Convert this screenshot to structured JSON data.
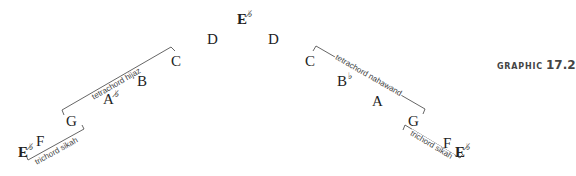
{
  "graphic": {
    "word": "GRAPHIC",
    "number": "17.2"
  },
  "accidentals": {
    "half_flat": "♭̸",
    "flat": "♭"
  },
  "top_note": {
    "letter": "E",
    "accidental": "half-flat",
    "accidental_glyph": "♭̸"
  },
  "left_scale": {
    "notes": [
      {
        "letter": "E",
        "accidental_glyph": "♭̸"
      },
      {
        "letter": "F",
        "accidental_glyph": ""
      },
      {
        "letter": "G",
        "accidental_glyph": ""
      },
      {
        "letter": "A",
        "accidental_glyph": "♭̸"
      },
      {
        "letter": "B",
        "accidental_glyph": ""
      },
      {
        "letter": "C",
        "accidental_glyph": ""
      },
      {
        "letter": "D",
        "accidental_glyph": ""
      }
    ],
    "brackets": [
      {
        "label": "trichord sikah"
      },
      {
        "label": "tetrachord hijaz"
      }
    ]
  },
  "right_scale": {
    "notes": [
      {
        "letter": "D",
        "accidental_glyph": ""
      },
      {
        "letter": "C",
        "accidental_glyph": ""
      },
      {
        "letter": "B",
        "accidental_glyph": "♭"
      },
      {
        "letter": "A",
        "accidental_glyph": ""
      },
      {
        "letter": "G",
        "accidental_glyph": ""
      },
      {
        "letter": "F",
        "accidental_glyph": ""
      },
      {
        "letter": "E",
        "accidental_glyph": "♭̸"
      }
    ],
    "brackets": [
      {
        "label": "tetrachord nahawand"
      },
      {
        "label": "trichord sikah"
      }
    ]
  },
  "colors": {
    "line": "#555555",
    "text": "#222222",
    "label": "#444444"
  }
}
